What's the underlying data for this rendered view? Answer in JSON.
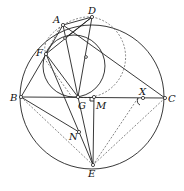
{
  "figure": {
    "title": "",
    "labels": {
      "A": "A",
      "B": "B",
      "C": "C",
      "D": "D",
      "E": "E",
      "F": "F",
      "G": "G",
      "M": "M",
      "N": "N",
      "X": "X"
    }
  },
  "points": {
    "A": [
      63,
      25
    ],
    "B": [
      21,
      97
    ],
    "C": [
      165,
      98
    ],
    "D": [
      92,
      17
    ],
    "E": [
      93,
      165
    ],
    "F": [
      46,
      54
    ],
    "G": [
      78,
      97
    ],
    "M": [
      94,
      97
    ],
    "N": [
      79,
      132
    ],
    "X": [
      143,
      98
    ],
    "P1": [
      65,
      38
    ],
    "P2": [
      86,
      57
    ]
  },
  "circles": {
    "circumcircle": {
      "cx": 92,
      "cy": 97,
      "r": 72,
      "style": "solid"
    },
    "inner": {
      "cx": 74,
      "cy": 66,
      "r": 31,
      "style": "solid"
    },
    "dashed_right": {
      "cx": 87,
      "cy": 57,
      "r": 39,
      "style": "dashed"
    }
  }
}
